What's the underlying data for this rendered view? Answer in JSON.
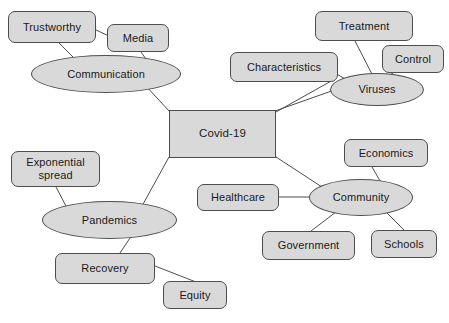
{
  "diagram": {
    "type": "concept-map",
    "colors": {
      "node_fill": "#d9d9d9",
      "node_border": "#4d4d4d",
      "edge": "#4d4d4d",
      "text": "#1a1a1a",
      "background": "#ffffff"
    },
    "nodes": [
      {
        "id": "trustworthy",
        "label": "Trustworthy",
        "shape": "rounded-rect",
        "x": 8,
        "y": 11,
        "w": 88,
        "h": 32
      },
      {
        "id": "media",
        "label": "Media",
        "shape": "rounded-rect",
        "x": 107,
        "y": 24,
        "w": 62,
        "h": 28
      },
      {
        "id": "communication",
        "label": "Communication",
        "shape": "ellipse",
        "x": 31,
        "y": 55,
        "w": 150,
        "h": 38
      },
      {
        "id": "treatment",
        "label": "Treatment",
        "shape": "rounded-rect",
        "x": 315,
        "y": 11,
        "w": 98,
        "h": 30
      },
      {
        "id": "control",
        "label": "Control",
        "shape": "rounded-rect",
        "x": 382,
        "y": 45,
        "w": 62,
        "h": 28
      },
      {
        "id": "characteristics",
        "label": "Characteristics",
        "shape": "rounded-rect",
        "x": 230,
        "y": 52,
        "w": 108,
        "h": 30
      },
      {
        "id": "viruses",
        "label": "Viruses",
        "shape": "ellipse",
        "x": 330,
        "y": 73,
        "w": 94,
        "h": 33
      },
      {
        "id": "covid19",
        "label": "Covid-19",
        "shape": "rect",
        "x": 169,
        "y": 110,
        "w": 107,
        "h": 48
      },
      {
        "id": "economics",
        "label": "Economics",
        "shape": "rounded-rect",
        "x": 344,
        "y": 139,
        "w": 84,
        "h": 28
      },
      {
        "id": "exponential-spread",
        "label": "Exponential\nspread",
        "shape": "rounded-rect",
        "x": 11,
        "y": 151,
        "w": 89,
        "h": 36
      },
      {
        "id": "healthcare",
        "label": "Healthcare",
        "shape": "rounded-rect",
        "x": 197,
        "y": 184,
        "w": 82,
        "h": 27
      },
      {
        "id": "community",
        "label": "Community",
        "shape": "ellipse",
        "x": 309,
        "y": 179,
        "w": 104,
        "h": 37
      },
      {
        "id": "pandemics",
        "label": "Pandemics",
        "shape": "ellipse",
        "x": 42,
        "y": 201,
        "w": 135,
        "h": 38
      },
      {
        "id": "government",
        "label": "Government",
        "shape": "rounded-rect",
        "x": 262,
        "y": 231,
        "w": 93,
        "h": 29
      },
      {
        "id": "schools",
        "label": "Schools",
        "shape": "rounded-rect",
        "x": 371,
        "y": 230,
        "w": 66,
        "h": 28
      },
      {
        "id": "recovery",
        "label": "Recovery",
        "shape": "rounded-rect",
        "x": 55,
        "y": 253,
        "w": 100,
        "h": 31
      },
      {
        "id": "equity",
        "label": "Equity",
        "shape": "rounded-rect",
        "x": 163,
        "y": 281,
        "w": 64,
        "h": 28
      }
    ],
    "edges": [
      {
        "from": "trustworthy",
        "to": "media",
        "x1": 96,
        "y1": 30,
        "x2": 113,
        "y2": 38
      },
      {
        "from": "trustworthy",
        "to": "communication",
        "x1": 59,
        "y1": 43,
        "x2": 76,
        "y2": 60
      },
      {
        "from": "media",
        "to": "communication",
        "x1": 141,
        "y1": 52,
        "x2": 148,
        "y2": 62
      },
      {
        "from": "communication",
        "to": "covid19",
        "x1": 145,
        "y1": 85,
        "x2": 170,
        "y2": 112
      },
      {
        "from": "covid19",
        "to": "viruses",
        "x1": 275,
        "y1": 111,
        "x2": 340,
        "y2": 88
      },
      {
        "from": "characteristics",
        "to": "viruses",
        "x1": 335,
        "y1": 73,
        "x2": 347,
        "y2": 80
      },
      {
        "from": "characteristics",
        "to": "covid19",
        "x1": 333,
        "y1": 80,
        "x2": 276,
        "y2": 112
      },
      {
        "from": "treatment",
        "to": "viruses",
        "x1": 355,
        "y1": 41,
        "x2": 375,
        "y2": 80
      },
      {
        "from": "control",
        "to": "viruses",
        "x1": 393,
        "y1": 73,
        "x2": 379,
        "y2": 82
      },
      {
        "from": "covid19",
        "to": "community",
        "x1": 276,
        "y1": 157,
        "x2": 322,
        "y2": 187
      },
      {
        "from": "economics",
        "to": "community",
        "x1": 372,
        "y1": 167,
        "x2": 383,
        "y2": 186
      },
      {
        "from": "healthcare",
        "to": "community",
        "x1": 279,
        "y1": 197,
        "x2": 311,
        "y2": 197
      },
      {
        "from": "community",
        "to": "government",
        "x1": 336,
        "y1": 212,
        "x2": 311,
        "y2": 231
      },
      {
        "from": "community",
        "to": "schools",
        "x1": 386,
        "y1": 212,
        "x2": 404,
        "y2": 230
      },
      {
        "from": "covid19",
        "to": "pandemics",
        "x1": 169,
        "y1": 157,
        "x2": 142,
        "y2": 206
      },
      {
        "from": "exponential-spread",
        "to": "pandemics",
        "x1": 56,
        "y1": 187,
        "x2": 67,
        "y2": 208
      },
      {
        "from": "pandemics",
        "to": "recovery",
        "x1": 134,
        "y1": 232,
        "x2": 120,
        "y2": 253
      },
      {
        "from": "recovery",
        "to": "equity",
        "x1": 155,
        "y1": 266,
        "x2": 196,
        "y2": 282
      }
    ]
  }
}
